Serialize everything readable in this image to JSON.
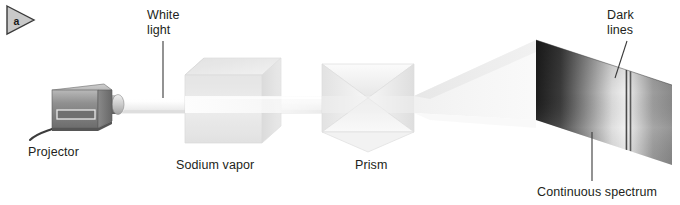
{
  "figure": {
    "panel_badge": "a",
    "panel_badge_icon": "triangle-play-badge-icon",
    "background_color": "#ffffff",
    "text_color": "#231f20"
  },
  "labels": {
    "white_light": "White\nlight",
    "dark_lines": "Dark\nlines",
    "projector": "Projector",
    "sodium_vapor": "Sodium vapor",
    "prism": "Prism",
    "continuous_spectrum": "Continuous spectrum"
  },
  "components": [
    {
      "id": "projector",
      "name": "Projector",
      "type": "light-source",
      "color": "#8c8c8c",
      "x": 46,
      "y": 88,
      "width": 78,
      "height": 48
    },
    {
      "id": "beam",
      "name": "White light beam",
      "type": "light-beam",
      "color": "#f2f2f2",
      "from_x": 124,
      "to_x": 330,
      "center_y": 105
    },
    {
      "id": "sodium-vapor-cell",
      "name": "Sodium vapor",
      "type": "absorbing-gas-cell",
      "color": "#e9e9e9",
      "x": 185,
      "y": 58,
      "width": 96,
      "height": 86
    },
    {
      "id": "prism",
      "name": "Prism",
      "type": "dispersing-prism",
      "color": "#efefef",
      "x": 322,
      "y": 62,
      "width": 92,
      "height": 86
    },
    {
      "id": "fan-beam",
      "name": "Dispersed fan beam",
      "type": "light-beam",
      "color": "#f4f4f4",
      "from_x": 414,
      "to_x": 536
    },
    {
      "id": "continuous-spectrum",
      "name": "Continuous spectrum",
      "type": "projection-screen",
      "x": 536,
      "y": 40,
      "width": 136,
      "height": 125
    }
  ],
  "spectrum": {
    "title": "Continuous spectrum",
    "orientation": "horizontal",
    "gradient_stops": [
      {
        "position": 0,
        "color": "#1c1c1c"
      },
      {
        "position": 18,
        "color": "#3a3a3a"
      },
      {
        "position": 38,
        "color": "#8e8e8e"
      },
      {
        "position": 56,
        "color": "#dcdcdc"
      },
      {
        "position": 66,
        "color": "#f0f0f0"
      },
      {
        "position": 74,
        "color": "#cfcfcf"
      },
      {
        "position": 86,
        "color": "#9d9d9d"
      },
      {
        "position": 100,
        "color": "#8a8a8a"
      }
    ],
    "dark_lines": [
      {
        "id": "sodium-D1",
        "position_pct": 66.5,
        "color": "#4a4a4a",
        "width_px": 1.6
      },
      {
        "id": "sodium-D2",
        "position_pct": 69.5,
        "color": "#5a5a5a",
        "width_px": 1.6
      }
    ],
    "dark_lines_count": 2
  },
  "leader_lines": [
    {
      "id": "leader-white-light",
      "from": "White light",
      "x1": 163,
      "y1": 41,
      "x2": 163,
      "y2": 98
    },
    {
      "id": "leader-dark-lines",
      "from": "Dark lines",
      "x1": 627,
      "y1": 41,
      "x2": 615,
      "y2": 78
    },
    {
      "id": "leader-continuous",
      "from": "Continuous spectrum",
      "x1": 592,
      "y1": 132,
      "x2": 592,
      "y2": 181
    }
  ]
}
